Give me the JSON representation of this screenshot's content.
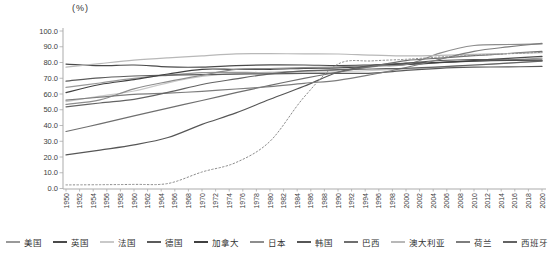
{
  "chart_data": {
    "type": "line",
    "title": "",
    "unit_label": "(%)",
    "xlabel": "",
    "ylabel": "(%)",
    "ylim": [
      0,
      100
    ],
    "y_ticks": [
      0,
      10,
      20,
      30,
      40,
      50,
      60,
      70,
      80,
      90,
      100
    ],
    "y_tick_decimals": 1,
    "x_tick_years": [
      1950,
      1952,
      1954,
      1956,
      1958,
      1960,
      1962,
      1964,
      1966,
      1968,
      1970,
      1972,
      1974,
      1976,
      1978,
      1980,
      1982,
      1984,
      1986,
      1988,
      1990,
      1992,
      1994,
      1996,
      1998,
      2000,
      2002,
      2004,
      2006,
      2008,
      2010,
      2012,
      2014,
      2016,
      2018,
      2020
    ],
    "x": [
      1950,
      1955,
      1960,
      1965,
      1970,
      1975,
      1980,
      1985,
      1990,
      1995,
      2000,
      2005,
      2010,
      2015,
      2020
    ],
    "grid": "none",
    "legend_position": "bottom",
    "axis_color": "#ababab",
    "tick_text_color": "#3d3d3d",
    "series": [
      {
        "name": "美国",
        "color": "#999999",
        "style": "solid",
        "in_legend": true,
        "values": [
          64.2,
          67.0,
          70.0,
          71.9,
          73.6,
          73.7,
          73.7,
          74.5,
          75.3,
          77.3,
          79.1,
          80.0,
          80.8,
          81.7,
          82.7
        ]
      },
      {
        "name": "英国",
        "color": "#4a4a4a",
        "style": "solid",
        "in_legend": true,
        "values": [
          79.0,
          78.0,
          78.4,
          77.2,
          77.1,
          78.0,
          78.5,
          78.4,
          78.1,
          78.4,
          78.7,
          79.9,
          81.3,
          82.6,
          83.9
        ]
      },
      {
        "name": "法国",
        "color": "#c9c9c9",
        "style": "solid",
        "in_legend": true,
        "values": [
          55.2,
          58.6,
          61.9,
          67.1,
          71.1,
          72.9,
          73.3,
          73.8,
          74.1,
          74.9,
          75.9,
          77.1,
          78.3,
          79.7,
          81.0
        ]
      },
      {
        "name": "德国",
        "color": "#5b5b5b",
        "style": "solid",
        "in_legend": true,
        "values": [
          68.1,
          70.3,
          71.4,
          72.0,
          72.3,
          72.6,
          72.8,
          73.0,
          73.1,
          73.3,
          75.0,
          76.3,
          77.0,
          77.2,
          77.5
        ]
      },
      {
        "name": "加拿大",
        "color": "#404040",
        "style": "solid",
        "in_legend": true,
        "values": [
          60.9,
          66.0,
          69.1,
          72.7,
          75.7,
          75.6,
          75.7,
          76.3,
          76.6,
          77.7,
          79.5,
          80.1,
          80.9,
          81.3,
          81.6
        ]
      },
      {
        "name": "日本",
        "color": "#8d8d8d",
        "style": "solid",
        "in_legend": true,
        "values": [
          53.4,
          56.3,
          63.3,
          67.9,
          71.9,
          75.7,
          76.2,
          76.7,
          77.3,
          78.0,
          78.6,
          86.0,
          90.8,
          91.4,
          91.8
        ]
      },
      {
        "name": "韩国",
        "color": "#565656",
        "style": "solid",
        "in_legend": true,
        "values": [
          21.4,
          24.4,
          27.7,
          32.4,
          40.7,
          48.0,
          56.7,
          64.9,
          73.8,
          78.2,
          79.6,
          81.3,
          81.9,
          81.6,
          81.4
        ]
      },
      {
        "name": "巴西",
        "color": "#6f6f6f",
        "style": "solid",
        "in_legend": true,
        "values": [
          36.2,
          41.0,
          46.1,
          51.0,
          55.9,
          60.8,
          65.5,
          69.9,
          73.9,
          77.6,
          81.2,
          82.8,
          84.3,
          85.7,
          87.1
        ]
      },
      {
        "name": "澳大利亚",
        "color": "#b8b8b8",
        "style": "solid",
        "in_legend": true,
        "values": [
          77.0,
          79.3,
          81.5,
          83.0,
          84.2,
          85.5,
          85.6,
          85.5,
          85.4,
          84.7,
          84.2,
          84.6,
          85.2,
          85.7,
          86.2
        ]
      },
      {
        "name": "荷兰",
        "color": "#7d7d7d",
        "style": "solid",
        "in_legend": true,
        "values": [
          56.1,
          58.0,
          59.8,
          60.6,
          61.7,
          63.2,
          64.7,
          66.8,
          68.7,
          72.4,
          76.8,
          82.0,
          87.1,
          89.9,
          92.2
        ]
      },
      {
        "name": "西班牙",
        "color": "#636363",
        "style": "solid",
        "in_legend": true,
        "values": [
          51.9,
          54.3,
          56.6,
          61.0,
          66.0,
          69.6,
          72.8,
          74.7,
          75.4,
          75.9,
          76.3,
          77.3,
          78.4,
          79.6,
          80.8
        ]
      },
      {
        "name": "",
        "color": "#8a8a8a",
        "style": "dotted",
        "in_legend": false,
        "values": [
          2.3,
          2.4,
          2.6,
          3.2,
          10.5,
          16.5,
          30.0,
          58.0,
          79.0,
          81.0,
          82.0,
          83.5,
          84.5,
          85.5,
          86.5
        ]
      }
    ]
  }
}
